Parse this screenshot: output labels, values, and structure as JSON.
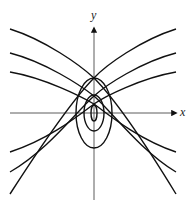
{
  "figure": {
    "x_axis_label": "x",
    "y_axis_label": "y",
    "stroke_color": "#111111"
  }
}
